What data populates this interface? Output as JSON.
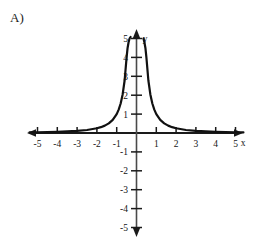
{
  "part_label": "A)",
  "chart_data": {
    "type": "line",
    "title": "",
    "xlabel": "x",
    "ylabel": "y",
    "xlim": [
      -5.6,
      5.6
    ],
    "ylim": [
      -5.6,
      5.6
    ],
    "grid": false,
    "legend": null,
    "axis_style": {
      "arrows": "both-ends-both-axes",
      "line_color": "#1a1a1a",
      "curve_color": "#111111",
      "curve_width": 2.2
    },
    "x_ticks": [
      -5,
      -4,
      -3,
      -2,
      -1,
      1,
      2,
      3,
      4,
      5
    ],
    "x_tick_labels": [
      "-5",
      "-4",
      "-3",
      "-2",
      "-1",
      "1",
      "2",
      "3",
      "4",
      "5"
    ],
    "y_ticks": [
      -5,
      -4,
      -3,
      -2,
      -1,
      1,
      2,
      3,
      4,
      5
    ],
    "y_tick_labels": [
      "-5",
      "-4",
      "-3",
      "-2",
      "-1",
      "1",
      "2",
      "3",
      "4",
      "5"
    ],
    "series": [
      {
        "name": "curve",
        "description": "even peaked decay curve, vertical asymptote at x = 0",
        "x": [
          -5.4,
          -5.0,
          -4.5,
          -4.0,
          -3.5,
          -3.0,
          -2.5,
          -2.0,
          -1.8,
          -1.6,
          -1.4,
          -1.2,
          -1.0,
          -0.9,
          -0.8,
          -0.7,
          -0.6,
          -0.5,
          -0.45,
          -0.4,
          -0.35,
          -0.3,
          -0.25,
          -0.2,
          -0.16,
          -0.13,
          -0.11,
          -0.09,
          -0.075,
          -0.06,
          -0.05,
          0.05,
          0.06,
          0.075,
          0.09,
          0.11,
          0.13,
          0.16,
          0.2,
          0.25,
          0.3,
          0.35,
          0.4,
          0.45,
          0.5,
          0.6,
          0.7,
          0.8,
          0.9,
          1.0,
          1.2,
          1.4,
          1.6,
          1.8,
          2.0,
          2.5,
          3.0,
          3.5,
          4.0,
          4.5,
          5.0,
          5.4
        ],
        "y": [
          0.034,
          0.04,
          0.049,
          0.063,
          0.082,
          0.111,
          0.16,
          0.25,
          0.309,
          0.391,
          0.51,
          0.694,
          1.0,
          1.235,
          1.563,
          2.041,
          2.778,
          4.0,
          4.5,
          4.8,
          5.0,
          5.2,
          5.3,
          5.4,
          5.45,
          5.5,
          5.5,
          5.5,
          5.5,
          5.5,
          5.5,
          5.5,
          5.5,
          5.5,
          5.5,
          5.5,
          5.5,
          5.45,
          5.4,
          5.3,
          5.2,
          5.0,
          4.8,
          4.5,
          4.0,
          2.778,
          2.041,
          1.563,
          1.235,
          1.0,
          0.694,
          0.51,
          0.391,
          0.309,
          0.25,
          0.16,
          0.111,
          0.082,
          0.063,
          0.049,
          0.04,
          0.034
        ]
      }
    ],
    "annotations": [
      {
        "text": "y",
        "position": "top of vertical axis, right side"
      },
      {
        "text": "x",
        "position": "right end of horizontal axis, below"
      }
    ]
  }
}
